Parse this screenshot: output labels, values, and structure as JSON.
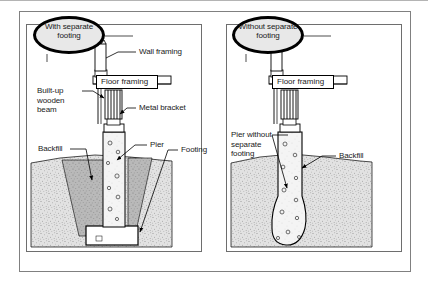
{
  "document": {
    "title": "Pier and footing construction comparison diagram",
    "type": "construction cross-section illustration",
    "panel_count": 2
  },
  "colors": {
    "outline": "#000000",
    "frame": "#808080",
    "callout_fill": "#e8e8e8",
    "soil_fill": "#d9d9d9",
    "backfill_fill": "#b0b0b0",
    "concrete_fill": "#f2f2f2",
    "wood_fill": "#d6d6cc",
    "page_background": "#ffffff"
  },
  "left_panel": {
    "callout": "With\nseparate\nfooting",
    "callout_lines": [
      "With",
      "separate",
      "footing"
    ],
    "labels": {
      "wall_framing": "Wall framing",
      "floor_framing": "Floor framing",
      "built_up_beam": "Built-up\nwooden\nbeam",
      "metal_bracket": "Metal bracket",
      "backfill": "Backfill",
      "pier": "Pier",
      "footing": "Footing"
    }
  },
  "right_panel": {
    "callout": "Without\nseparate\nfooting",
    "callout_lines": [
      "Without",
      "separate",
      "footing"
    ],
    "labels": {
      "floor_framing": "Floor framing",
      "pier_without_separate_footing": "Pier without\nseparate\nfooting",
      "backfill": "Backfill"
    }
  }
}
